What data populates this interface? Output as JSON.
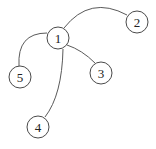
{
  "diagram": {
    "type": "tree-graph",
    "nodes": [
      {
        "id": "1",
        "label": "1",
        "x": 58,
        "y": 38
      },
      {
        "id": "2",
        "label": "2",
        "x": 137,
        "y": 22
      },
      {
        "id": "3",
        "label": "3",
        "x": 101,
        "y": 73
      },
      {
        "id": "4",
        "label": "4",
        "x": 38,
        "y": 127
      },
      {
        "id": "5",
        "label": "5",
        "x": 20,
        "y": 77
      }
    ],
    "edges": [
      {
        "from": "1",
        "to": "2",
        "style": "curved"
      },
      {
        "from": "1",
        "to": "3",
        "style": "curved"
      },
      {
        "from": "1",
        "to": "4",
        "style": "curved"
      },
      {
        "from": "1",
        "to": "5",
        "style": "curved"
      }
    ],
    "node_radius": 11,
    "colors": {
      "stroke": "#4a4a4a",
      "fill": "#ffffff",
      "text": "#222222"
    }
  }
}
